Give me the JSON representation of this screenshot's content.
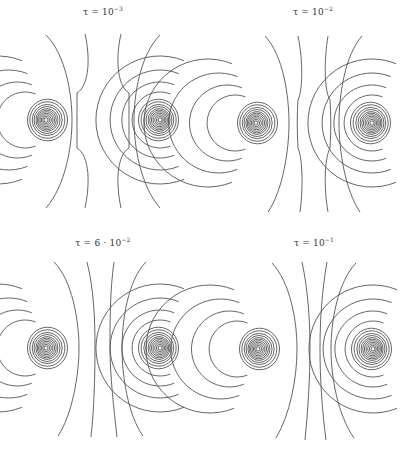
{
  "figure": {
    "panels": [
      {
        "id": "tl",
        "label_prefix": "τ = 10",
        "label_exp": "−3",
        "label_x": 103,
        "label_y": 5,
        "cores": [
          [
            46,
            120
          ],
          [
            160,
            120
          ]
        ],
        "inner_radii": [
          2,
          3.5,
          5,
          6.5,
          8,
          9.5,
          11,
          13,
          15,
          17.5,
          20
        ],
        "outer_arcs": [
          {
            "cx": 46,
            "cy": 120,
            "r": 28,
            "side": "left"
          },
          {
            "cx": 46,
            "cy": 120,
            "r": 38,
            "side": "left"
          },
          {
            "cx": 46,
            "cy": 120,
            "r": 50,
            "side": "left"
          },
          {
            "cx": 46,
            "cy": 120,
            "r": 64,
            "side": "left"
          },
          {
            "cx": 160,
            "cy": 120,
            "r": 28,
            "side": "right"
          },
          {
            "cx": 160,
            "cy": 120,
            "r": 38,
            "side": "right"
          },
          {
            "cx": 160,
            "cy": 120,
            "r": 50,
            "side": "right"
          },
          {
            "cx": 160,
            "cy": 120,
            "r": 64,
            "side": "right"
          }
        ],
        "separatrix": [
          "M 46 35 C 66 55, 72 95, 72 120 C 72 145, 66 185, 46 208",
          "M 160 35 C 140 55, 134 95, 134 120 C 134 145, 140 185, 160 208",
          "M 85 34 C 90 55, 90 85, 77 93 C 77 110, 77 130, 77 148 C 90 156, 90 185, 85 208",
          "M 121 34 C 116 55, 116 85, 129 93 C 129 110, 129 130, 129 148 C 116 156, 116 185, 121 208"
        ]
      },
      {
        "id": "tr",
        "label_prefix": "τ = 10",
        "label_exp": "−2",
        "label_x": 313,
        "label_y": 5,
        "cores": [
          [
            256,
            123
          ],
          [
            372,
            123
          ]
        ],
        "inner_radii": [
          2,
          3.5,
          5,
          6.5,
          8,
          9.5,
          11,
          13,
          15,
          17.5,
          20
        ],
        "outer_arcs": [
          {
            "cx": 256,
            "cy": 123,
            "r": 28,
            "side": "left"
          },
          {
            "cx": 256,
            "cy": 123,
            "r": 38,
            "side": "left"
          },
          {
            "cx": 256,
            "cy": 123,
            "r": 50,
            "side": "left"
          },
          {
            "cx": 256,
            "cy": 123,
            "r": 64,
            "side": "left"
          },
          {
            "cx": 372,
            "cy": 123,
            "r": 28,
            "side": "right"
          },
          {
            "cx": 372,
            "cy": 123,
            "r": 38,
            "side": "right"
          },
          {
            "cx": 372,
            "cy": 123,
            "r": 50,
            "side": "right"
          },
          {
            "cx": 372,
            "cy": 123,
            "r": 64,
            "side": "right"
          }
        ],
        "separatrix": [
          "M 265 36 C 283 55, 289 95, 289 123 C 289 150, 283 190, 268 212",
          "M 362 36 C 345 55, 339 95, 339 123 C 339 150, 345 190, 360 212",
          "M 298 36 C 303 60, 303 90, 298 100 C 297 115, 297 130, 298 148 C 303 160, 303 190, 300 212",
          "M 328 36 C 324 60, 324 90, 330 100 C 331 115, 331 130, 330 148 C 324 160, 324 190, 328 212"
        ]
      },
      {
        "id": "bl",
        "label_prefix": "τ = 6 · 10",
        "label_exp": "−2",
        "label_x": 103,
        "label_y": 236,
        "cores": [
          [
            46,
            348
          ],
          [
            160,
            348
          ]
        ],
        "inner_radii": [
          2,
          3.5,
          5,
          6.5,
          8,
          9.5,
          11,
          13,
          15,
          17.5,
          20
        ],
        "outer_arcs": [
          {
            "cx": 46,
            "cy": 348,
            "r": 28,
            "side": "left"
          },
          {
            "cx": 46,
            "cy": 348,
            "r": 38,
            "side": "left"
          },
          {
            "cx": 46,
            "cy": 348,
            "r": 50,
            "side": "left"
          },
          {
            "cx": 46,
            "cy": 348,
            "r": 64,
            "side": "left"
          },
          {
            "cx": 160,
            "cy": 348,
            "r": 28,
            "side": "right"
          },
          {
            "cx": 160,
            "cy": 348,
            "r": 38,
            "side": "right"
          },
          {
            "cx": 160,
            "cy": 348,
            "r": 50,
            "side": "right"
          },
          {
            "cx": 160,
            "cy": 348,
            "r": 64,
            "side": "right"
          }
        ],
        "separatrix": [
          "M 54 262 C 72 280, 79 320, 79 348 C 79 376, 72 415, 58 436",
          "M 146 262 C 128 280, 122 320, 122 348 C 122 376, 128 415, 143 436",
          "M 87 262 C 94 290, 95 320, 95 348 C 95 376, 94 410, 91 437",
          "M 114 262 C 110 290, 110 320, 110 348 C 110 376, 114 410, 117 437"
        ]
      },
      {
        "id": "br",
        "label_prefix": "τ = 10",
        "label_exp": "−1",
        "label_x": 314,
        "label_y": 236,
        "cores": [
          [
            258,
            349
          ],
          [
            373,
            349
          ]
        ],
        "inner_radii": [
          2,
          3.5,
          5,
          6.5,
          8,
          9.5,
          11,
          13,
          15,
          17.5,
          20
        ],
        "outer_arcs": [
          {
            "cx": 258,
            "cy": 349,
            "r": 28,
            "side": "left"
          },
          {
            "cx": 258,
            "cy": 349,
            "r": 38,
            "side": "left"
          },
          {
            "cx": 258,
            "cy": 349,
            "r": 50,
            "side": "left"
          },
          {
            "cx": 258,
            "cy": 349,
            "r": 64,
            "side": "left"
          },
          {
            "cx": 373,
            "cy": 349,
            "r": 28,
            "side": "right"
          },
          {
            "cx": 373,
            "cy": 349,
            "r": 38,
            "side": "right"
          },
          {
            "cx": 373,
            "cy": 349,
            "r": 50,
            "side": "right"
          },
          {
            "cx": 373,
            "cy": 349,
            "r": 64,
            "side": "right"
          }
        ],
        "separatrix": [
          "M 272 263 C 290 282, 297 320, 297 349 C 297 378, 290 415, 276 438",
          "M 356 263 C 338 282, 331 320, 331 349 C 331 378, 338 415, 354 438",
          "M 302 262 C 308 290, 310 320, 310 349 C 310 378, 308 410, 305 440",
          "M 327 262 C 322 290, 320 320, 320 349 C 320 378, 322 410, 326 440"
        ]
      }
    ]
  }
}
